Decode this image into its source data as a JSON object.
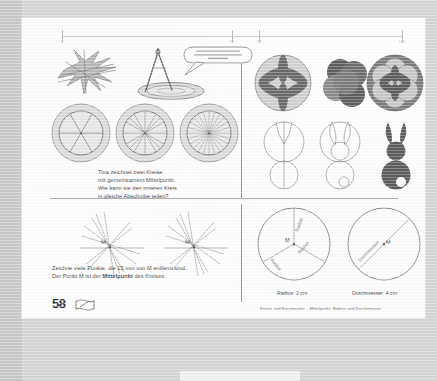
{
  "viewer": {
    "background_color": "#d5d5d5",
    "page_background": "#ffffff"
  },
  "ruler": {
    "name": "horizontal-ruler",
    "ticks": [
      {
        "pos_pct": 0,
        "label": "0"
      },
      {
        "pos_pct": 50,
        "label": "50"
      },
      {
        "pos_pct": 58,
        "label": "58"
      },
      {
        "pos_pct": 100,
        "label": "100"
      }
    ]
  },
  "page": {
    "page_number": "58",
    "footer_caption": "Kreise und Kreismuster – Mittelpunkt, Radius und Durchmesser"
  },
  "quadrant_top_left": {
    "name": "compass-and-circles",
    "speech_bubble": "Nehme ich einen breiten oder lieber einen schmalen Fuß???",
    "task_text_lines": [
      "Tina zeichnet zwei Kreise",
      "mit gemeinsamem Mittelpunkt.",
      "Wie kann sie den inneren Kreis",
      "in gleiche Abschnitte teilen?"
    ],
    "wheels": [
      {
        "spokes": 6
      },
      {
        "spokes": 12
      },
      {
        "spokes": 24
      }
    ]
  },
  "quadrant_top_right": {
    "name": "circle-patterns",
    "patterns_row1": [
      "rosette-6-petal",
      "three-overlapping-circles",
      "flower-of-life"
    ],
    "patterns_row2": [
      "rabbit-outline-step1",
      "rabbit-outline-step2",
      "rabbit-filled"
    ]
  },
  "quadrant_bottom_left": {
    "name": "points-around-m",
    "center_label": "M",
    "instruction_line1": "Zeichne viele Punkte, die 15 mm von M entfernt sind.",
    "instruction_line2_a": "Der Punkt M ist der ",
    "instruction_line2_bold": "Mittelpunkt",
    "instruction_line2_b": " des Kreises."
  },
  "quadrant_bottom_right": {
    "name": "radius-and-diameter",
    "radius_circle": {
      "center_label": "M",
      "spoke_labels": [
        "Radius",
        "Radius",
        "Radius"
      ],
      "caption": "Radius: 2 cm"
    },
    "diameter_circle": {
      "center_label": "M",
      "line_label": "Durchmesser",
      "caption": "Durchmesser: 4 cm"
    }
  },
  "colors": {
    "ink": "#3f3f3f",
    "line": "#8e8e8e",
    "pattern_dark": "#5a5a5a",
    "pattern_mid": "#8f8f8f",
    "pattern_light": "#c9c9c9",
    "paper": "#ffffff",
    "backdrop": "#d5d5d5"
  }
}
